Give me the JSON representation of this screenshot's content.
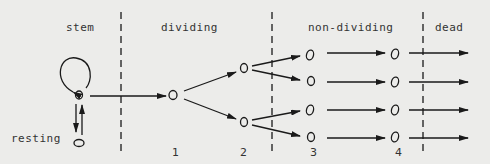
{
  "regions": [
    {
      "label": "stem"
    },
    {
      "label": "dividing"
    },
    {
      "label": "non-dividing"
    },
    {
      "label": "dead"
    }
  ],
  "side_label": "resting",
  "generation_numbers": [
    "1",
    "2",
    "3",
    "4"
  ],
  "colors": {
    "background": "#ececea",
    "ink": "#1a1a1a",
    "text": "#333333"
  }
}
